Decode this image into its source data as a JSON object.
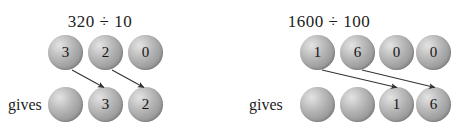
{
  "figure": {
    "title_left": "320 ÷ 10",
    "title_right": "1600 ÷ 100",
    "gives_label": "gives",
    "sphere_color": "#a9a9a9",
    "sphere_highlight": "#e3e3e3",
    "arrow_color": "#333333",
    "text_color": "#1c1c1c"
  },
  "diagrams": [
    {
      "id": "division-by-10",
      "expression": "320 ÷ 10",
      "dividend": "320",
      "divisor": "10",
      "operator": "÷",
      "quotient": "32",
      "gives_label": "gives",
      "top_row": {
        "label": "dividend-digits",
        "digits": [
          "3",
          "2",
          "0"
        ],
        "centers_x": [
          66,
          106,
          146
        ],
        "center_y": 53
      },
      "bottom_row": {
        "label": "result-digits",
        "digits": [
          "",
          "3",
          "2"
        ],
        "centers_x": [
          66,
          106,
          146
        ],
        "center_y": 104
      },
      "arrows": [
        {
          "name": "arrow-3-shift",
          "from_index": 0,
          "to_index": 1,
          "x1": 72,
          "y1": 70,
          "x2": 104,
          "y2": 88
        },
        {
          "name": "arrow-2-shift",
          "from_index": 1,
          "to_index": 2,
          "x1": 112,
          "y1": 70,
          "x2": 144,
          "y2": 88
        }
      ]
    },
    {
      "id": "division-by-100",
      "expression": "1600 ÷ 100",
      "dividend": "1600",
      "divisor": "100",
      "operator": "÷",
      "quotient": "16",
      "gives_label": "gives",
      "top_row": {
        "label": "dividend-digits",
        "digits": [
          "1",
          "6",
          "0",
          "0"
        ],
        "centers_x": [
          318,
          358,
          396,
          433
        ],
        "center_y": 53
      },
      "bottom_row": {
        "label": "result-digits",
        "digits": [
          "",
          "",
          "1",
          "6"
        ],
        "centers_x": [
          318,
          358,
          396,
          433
        ],
        "center_y": 104
      },
      "arrows": [
        {
          "name": "arrow-1-shift",
          "from_index": 0,
          "to_index": 2,
          "x1": 94,
          "y1": 70,
          "x2": 168,
          "y2": 88
        },
        {
          "name": "arrow-6-shift",
          "from_index": 1,
          "to_index": 3,
          "x1": 134,
          "y1": 70,
          "x2": 206,
          "y2": 88
        }
      ]
    }
  ]
}
